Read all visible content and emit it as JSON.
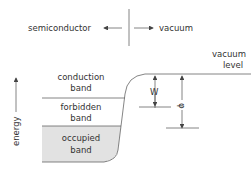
{
  "diagram": {
    "top": {
      "left_label": "semiconductor",
      "right_label": "vacuum"
    },
    "axis": {
      "label": "energy"
    },
    "bands": {
      "conduction_line1": "conduction",
      "conduction_line2": "band",
      "forbidden_line1": "forbidden",
      "forbidden_line2": "band",
      "occupied_line1": "occupied",
      "occupied_line2": "band"
    },
    "vacuum_level": {
      "line1": "vacuum",
      "line2": "level"
    },
    "quantities": {
      "w": "W",
      "phi": "φ"
    }
  }
}
